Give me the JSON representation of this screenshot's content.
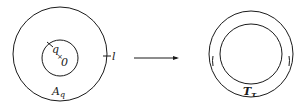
{
  "left_figure": {
    "region_label": "A",
    "region_label_sub": "q",
    "point_q_label": "q",
    "center_label": "0",
    "center_mark": "×",
    "boundary_label": "l"
  },
  "arrow": {
    "meaning": "maps-to"
  },
  "right_figure": {
    "region_label": "T",
    "region_label_sub": "τ"
  },
  "colors": {
    "ink": "#1a1a1a",
    "background": "#ffffff"
  }
}
